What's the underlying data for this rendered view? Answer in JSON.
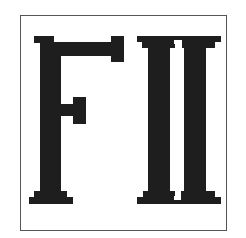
{
  "logo": {
    "text": "FII",
    "letters": [
      "F",
      "I",
      "I"
    ],
    "ink_color": "#1e1e1e",
    "border_color": "#555555",
    "background": "#ffffff"
  }
}
